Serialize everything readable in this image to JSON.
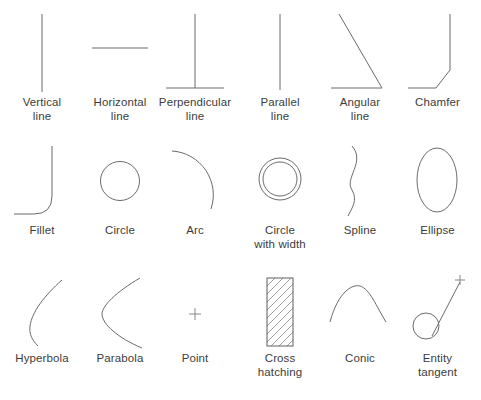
{
  "figure": {
    "type": "geometric-entity-reference-chart",
    "background_color": "#ffffff",
    "stroke_color": "#6b6b6b",
    "label_color": "#3c3c3c",
    "columns": 6,
    "rows": 3
  },
  "rows": [
    {
      "index": 0,
      "items": [
        {
          "icon": "vertical-line-icon",
          "label_line1": "Vertical",
          "label_line2": "line"
        },
        {
          "icon": "horizontal-line-icon",
          "label_line1": "Horizontal",
          "label_line2": "line"
        },
        {
          "icon": "perpendicular-line-icon",
          "label_line1": "Perpendicular",
          "label_line2": "line"
        },
        {
          "icon": "parallel-line-icon",
          "label_line1": "Parallel",
          "label_line2": "line"
        },
        {
          "icon": "angular-line-icon",
          "label_line1": "Angular",
          "label_line2": "line"
        },
        {
          "icon": "chamfer-icon",
          "label_line1": "Chamfer",
          "label_line2": ""
        }
      ]
    },
    {
      "index": 1,
      "items": [
        {
          "icon": "fillet-icon",
          "label_line1": "Fillet",
          "label_line2": ""
        },
        {
          "icon": "circle-icon",
          "label_line1": "Circle",
          "label_line2": ""
        },
        {
          "icon": "arc-icon",
          "label_line1": "Arc",
          "label_line2": ""
        },
        {
          "icon": "circle-with-width-icon",
          "label_line1": "Circle",
          "label_line2": "with width"
        },
        {
          "icon": "spline-icon",
          "label_line1": "Spline",
          "label_line2": ""
        },
        {
          "icon": "ellipse-icon",
          "label_line1": "Ellipse",
          "label_line2": ""
        }
      ]
    },
    {
      "index": 2,
      "items": [
        {
          "icon": "hyperbola-icon",
          "label_line1": "Hyperbola",
          "label_line2": ""
        },
        {
          "icon": "parabola-icon",
          "label_line1": "Parabola",
          "label_line2": ""
        },
        {
          "icon": "point-icon",
          "label_line1": "Point",
          "label_line2": ""
        },
        {
          "icon": "cross-hatching-icon",
          "label_line1": "Cross",
          "label_line2": "hatching"
        },
        {
          "icon": "conic-icon",
          "label_line1": "Conic",
          "label_line2": ""
        },
        {
          "icon": "entity-tangent-icon",
          "label_line1": "Entity",
          "label_line2": "tangent"
        }
      ]
    }
  ]
}
